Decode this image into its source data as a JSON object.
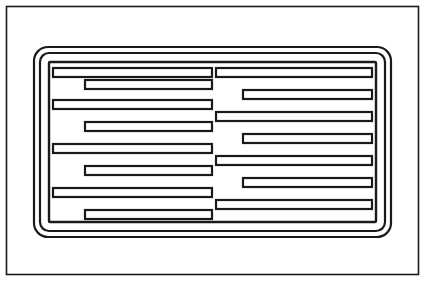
{
  "figure": {
    "kind": "patent-line-drawing",
    "background_color": "#ffffff",
    "stroke_color": "#1a1a1a",
    "canvas": {
      "width": 426,
      "height": 282
    }
  },
  "outer_frame": {
    "name": "outer-page-border",
    "x": 6.5,
    "y": 6.5,
    "width": 412,
    "height": 268,
    "rx": 0,
    "stroke_width": 1.6
  },
  "rounded_frames": [
    {
      "name": "frame-outer-rounded",
      "x": 34,
      "y": 47,
      "width": 357,
      "height": 190,
      "rx": 14,
      "stroke_width": 2.2
    },
    {
      "name": "frame-middle-rounded",
      "x": 40,
      "y": 53,
      "width": 345,
      "height": 178,
      "rx": 9,
      "stroke_width": 2.2
    },
    {
      "name": "frame-inner-rect",
      "x": 49,
      "y": 62,
      "width": 327,
      "height": 160,
      "rx": 1,
      "stroke_width": 2.4
    }
  ],
  "bars": {
    "stroke_width": 2.2,
    "bar_height": 9,
    "left_comb": {
      "name": "left-comb-fingers",
      "spine_x": 49,
      "long_start_x": 53,
      "short_start_x": 85,
      "long_end_x": 212,
      "short_end_x": 212,
      "fingers": [
        {
          "index": 0,
          "y": 68,
          "x": 53,
          "width": 159,
          "type": "long"
        },
        {
          "index": 1,
          "y": 80,
          "x": 85,
          "width": 127,
          "type": "short"
        },
        {
          "index": 2,
          "y": 100,
          "x": 53,
          "width": 159,
          "type": "long"
        },
        {
          "index": 3,
          "y": 122,
          "x": 85,
          "width": 127,
          "type": "short"
        },
        {
          "index": 4,
          "y": 144,
          "x": 53,
          "width": 159,
          "type": "long"
        },
        {
          "index": 5,
          "y": 166,
          "x": 85,
          "width": 127,
          "type": "short"
        },
        {
          "index": 6,
          "y": 188,
          "x": 53,
          "width": 159,
          "type": "long"
        },
        {
          "index": 7,
          "y": 210,
          "x": 85,
          "width": 127,
          "type": "short"
        }
      ]
    },
    "right_comb": {
      "name": "right-comb-fingers",
      "spine_x": 376,
      "long_end_x": 372,
      "short_end_x": 340,
      "start_x": 216,
      "fingers": [
        {
          "index": 0,
          "y": 68,
          "x": 216,
          "width": 156,
          "type": "long"
        },
        {
          "index": 1,
          "y": 90,
          "x": 243,
          "width": 129,
          "type": "short"
        },
        {
          "index": 2,
          "y": 112,
          "x": 216,
          "width": 156,
          "type": "long"
        },
        {
          "index": 3,
          "y": 134,
          "x": 243,
          "width": 129,
          "type": "short"
        },
        {
          "index": 4,
          "y": 156,
          "x": 216,
          "width": 156,
          "type": "long"
        },
        {
          "index": 5,
          "y": 178,
          "x": 243,
          "width": 129,
          "type": "short"
        },
        {
          "index": 6,
          "y": 200,
          "x": 216,
          "width": 156,
          "type": "long"
        }
      ]
    }
  },
  "counts": {
    "left_finger_count": 8,
    "right_finger_count": 7,
    "rounded_frame_count": 3
  }
}
